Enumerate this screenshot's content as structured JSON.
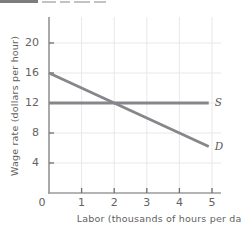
{
  "page": {
    "background": "#ffffff",
    "note_fragment": "cropped-illegible-text-top-left"
  },
  "chart_data": {
    "type": "line",
    "title": "",
    "xlabel": "Labor (thousands of hours per day)",
    "ylabel": "Wage rate (dollars per hour)",
    "xlim": [
      0,
      5.3
    ],
    "ylim": [
      0,
      23.5
    ],
    "xticks": [
      1,
      2,
      3,
      4,
      5
    ],
    "yticks": [
      4,
      8,
      12,
      16,
      20
    ],
    "origin_label": "0",
    "grid": true,
    "legend_position": "line-end-labels",
    "grid_color": "#e8e8e8",
    "axis_color": "#9b9b9b",
    "tick_color": "#6e6e6e",
    "label_color": "#5f5f5f",
    "line_color": "#86868b",
    "series": [
      {
        "name": "supply",
        "label": "S",
        "points": [
          [
            0,
            12
          ],
          [
            4.9,
            12
          ]
        ]
      },
      {
        "name": "demand",
        "label": "D",
        "points": [
          [
            0,
            16
          ],
          [
            4.9,
            6.2
          ]
        ]
      }
    ]
  }
}
